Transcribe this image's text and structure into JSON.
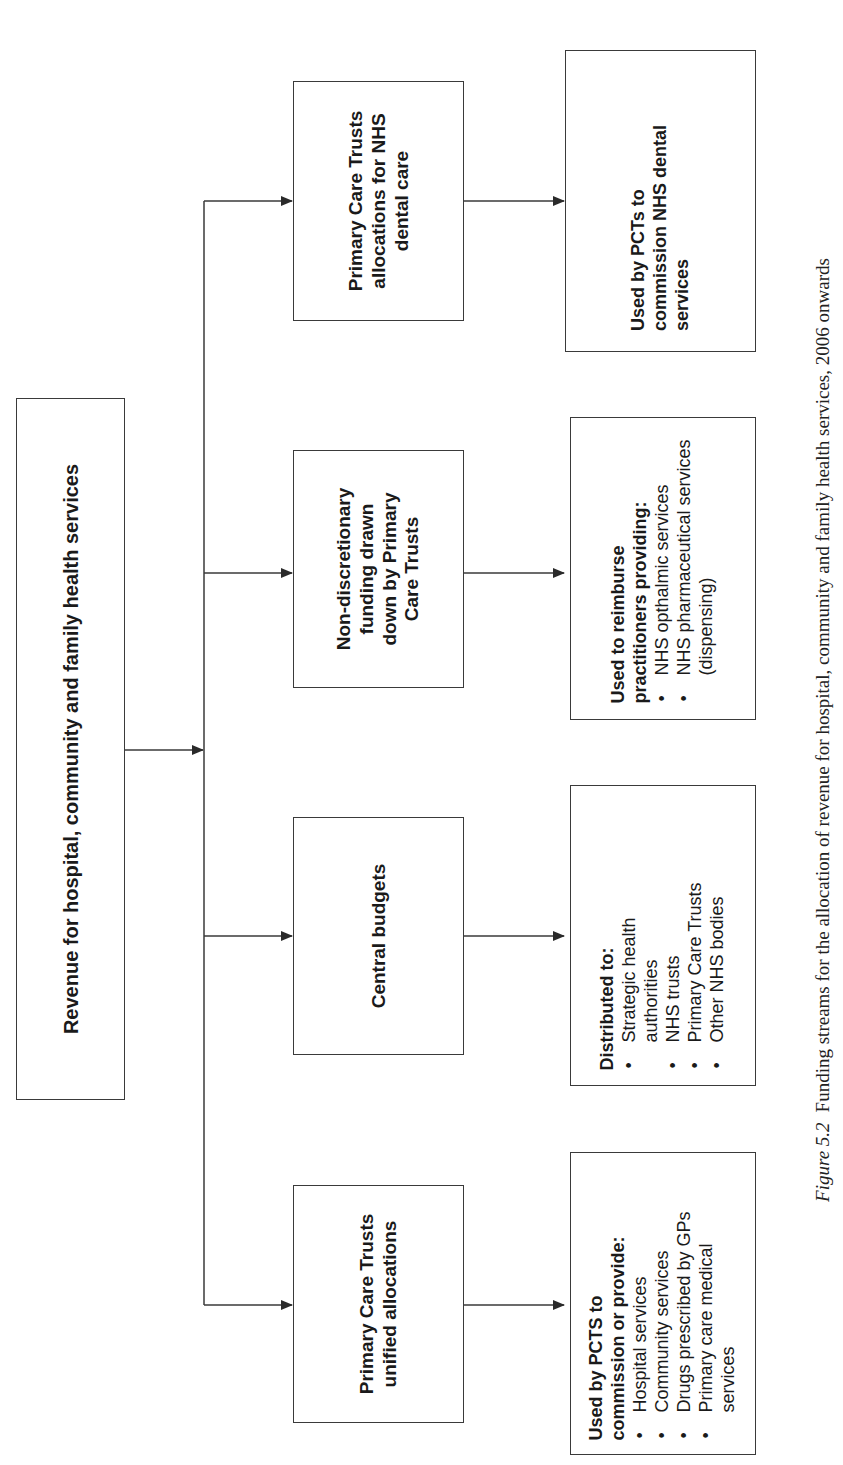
{
  "diagram": {
    "root": {
      "label": "Revenue for hospital, community and family health services"
    },
    "streams": [
      {
        "label": "Primary Care Trusts allocations for NHS dental care",
        "lines": [
          "Primary Care Trusts",
          "allocations for NHS",
          "dental care"
        ],
        "outcome": {
          "heading_lines": [
            "Used by PCTs to",
            "commission NHS dental",
            "services"
          ],
          "items": []
        }
      },
      {
        "label": "Non-discretionary funding drawn down by Primary Care Trusts",
        "lines": [
          "Non-discretionary",
          "funding drawn",
          "down by Primary",
          "Care Trusts"
        ],
        "outcome": {
          "heading_lines": [
            "Used to reimburse",
            "practitioners providing:"
          ],
          "items": [
            "NHS opthalmic services",
            "NHS pharmaceutical services (dispensing)"
          ]
        }
      },
      {
        "label": "Central budgets",
        "lines": [
          "Central budgets"
        ],
        "outcome": {
          "heading_lines": [
            "Distributed to:"
          ],
          "items": [
            "Strategic health authorities",
            "NHS trusts",
            "Primary Care Trusts",
            "Other NHS bodies"
          ]
        }
      },
      {
        "label": "Primary Care Trusts unified allocations",
        "lines": [
          "Primary Care Trusts",
          "unified allocations"
        ],
        "outcome": {
          "heading_lines": [
            "Used by PCTS to",
            "commission or provide:"
          ],
          "items": [
            "Hospital services",
            "Community services",
            "Drugs prescribed by GPs",
            "Primary care medical services"
          ]
        }
      }
    ]
  },
  "caption": {
    "figure_label": "Figure 5.2",
    "text": "Funding streams for the allocation of revenue for hospital, community and family health services, 2006 onwards"
  },
  "colors": {
    "line": "#3a3a3a",
    "background": "#ffffff"
  }
}
